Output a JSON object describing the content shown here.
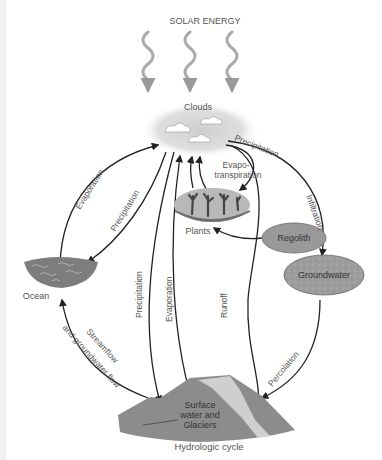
{
  "title": "Hydrologic cycle",
  "energy_label": "SOLAR ENERGY",
  "nodes": {
    "clouds": "Clouds",
    "plants": "Plants",
    "regolith": "Regolith",
    "groundwater": "Groundwater",
    "ocean": "Ocean",
    "surface_line1": "Surface",
    "surface_line2": "water and",
    "surface_line3": "Glaciers"
  },
  "flows": {
    "evaporation_ocean": "Evaporation",
    "precipitation_ocean": "Precipitation",
    "evapotranspiration_line1": "Evapo-",
    "evapotranspiration_line2": "transpiration",
    "precipitation_land": "Precipitation",
    "infiltration": "Infiltration",
    "precipitation_surface": "Precipitation",
    "evaporation_surface": "Evaporation",
    "runoff": "Runoff",
    "percolation": "Percolation",
    "streamflow_line1": "Streamflow",
    "streamflow_line2": "and groundwater flow"
  },
  "colors": {
    "arrow": "#222222",
    "label": "#555555",
    "node_fill": "#9a9a9a",
    "cloud_fill": "#d8d8d8",
    "surface_fill": "#8c8c8c",
    "surface_highlight": "#cfcfcf",
    "solar_wave": "#aaaaaa"
  }
}
